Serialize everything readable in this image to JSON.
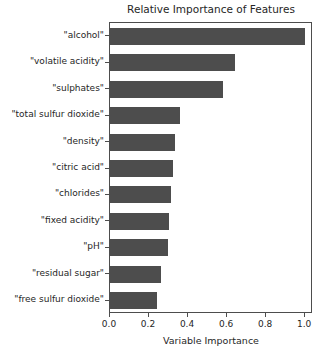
{
  "chart_data": {
    "type": "bar",
    "orientation": "horizontal",
    "title": "Relative Importance of Features",
    "xlabel": "Variable Importance",
    "ylabel": "",
    "xlim": [
      0.0,
      1.04
    ],
    "xticks": [
      "0.0",
      "0.2",
      "0.4",
      "0.6",
      "0.8",
      "1.0"
    ],
    "xtick_values": [
      0.0,
      0.2,
      0.4,
      0.6,
      0.8,
      1.0
    ],
    "grid": false,
    "legend": null,
    "bar_color": "#4d4d4d",
    "categories": [
      "\"alcohol\"",
      "\"volatile acidity\"",
      "\"sulphates\"",
      "\"total sulfur dioxide\"",
      "\"density\"",
      "\"citric acid\"",
      "\"chlorides\"",
      "\"fixed acidity\"",
      "\"pH\"",
      "\"residual sugar\"",
      "\"free sulfur dioxide\""
    ],
    "values": [
      1.0,
      0.64,
      0.58,
      0.36,
      0.335,
      0.325,
      0.31,
      0.3,
      0.295,
      0.26,
      0.24
    ]
  },
  "colors": {
    "bar": "#4d4d4d",
    "axis": "#4d4d4d",
    "text": "#262626",
    "background": "#ffffff"
  }
}
